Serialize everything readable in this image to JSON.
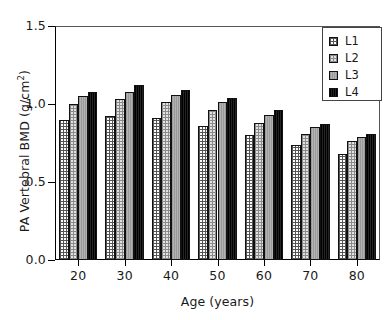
{
  "chart_data": {
    "type": "bar",
    "title": "",
    "subtitle": "",
    "xlabel": "Age (years)",
    "ylabel": "PA Vertebral BMD (g/cm²)",
    "ylabel_main": "PA Vertebral BMD (g/cm",
    "ylabel_sup": "2",
    "ylabel_tail": ")",
    "categories": [
      "20",
      "30",
      "40",
      "50",
      "60",
      "70",
      "80"
    ],
    "ylim": [
      0.0,
      1.5
    ],
    "yticks": [
      "0.0",
      "0.5",
      "1.0",
      "1.5"
    ],
    "ytick_values": [
      0.0,
      0.5,
      1.0,
      1.5
    ],
    "grid": false,
    "legend_position": "upper-right",
    "series": [
      {
        "name": "L1",
        "values": [
          0.9,
          0.92,
          0.91,
          0.86,
          0.8,
          0.74,
          0.68
        ]
      },
      {
        "name": "L2",
        "values": [
          1.0,
          1.03,
          1.01,
          0.96,
          0.88,
          0.81,
          0.76
        ]
      },
      {
        "name": "L3",
        "values": [
          1.05,
          1.08,
          1.06,
          1.01,
          0.93,
          0.85,
          0.79
        ]
      },
      {
        "name": "L4",
        "values": [
          1.08,
          1.12,
          1.09,
          1.04,
          0.96,
          0.87,
          0.81
        ]
      }
    ]
  },
  "legend": {
    "entries": [
      {
        "label": "L1",
        "swatch": "l1"
      },
      {
        "label": "L2",
        "swatch": "l2"
      },
      {
        "label": "L3",
        "swatch": "l3"
      },
      {
        "label": "L4",
        "swatch": "l4"
      }
    ]
  }
}
